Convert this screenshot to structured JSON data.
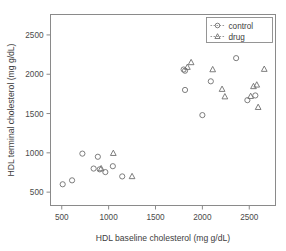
{
  "chart_data": {
    "type": "scatter",
    "title": "",
    "xlabel": "HDL baseline cholesterol (mg g/dL)",
    "ylabel": "HDL terminal cholesterol (mg g/dL)",
    "xlim": [
      380,
      2780
    ],
    "ylim": [
      330,
      2760
    ],
    "xticks": [
      500,
      1000,
      1500,
      2000,
      2500
    ],
    "xticklabels": [
      "500",
      "1000",
      "1500",
      "2000",
      "2500"
    ],
    "yticks": [
      500,
      1000,
      1500,
      2000,
      2500
    ],
    "yticklabels": [
      "500",
      "1000",
      "1500",
      "2000",
      "2500"
    ],
    "grid": false,
    "legend_position": "top-right",
    "series": [
      {
        "name": "control",
        "marker": "circle",
        "linestyle": "dashed",
        "color": "#6f6f6f",
        "points": [
          [
            510,
            600
          ],
          [
            610,
            650
          ],
          [
            720,
            990
          ],
          [
            840,
            800
          ],
          [
            885,
            950
          ],
          [
            905,
            790
          ],
          [
            965,
            755
          ],
          [
            1045,
            830
          ],
          [
            1145,
            700
          ],
          [
            1800,
            2060
          ],
          [
            1815,
            2045
          ],
          [
            1815,
            1800
          ],
          [
            2000,
            1480
          ],
          [
            2090,
            1910
          ],
          [
            2360,
            2205
          ],
          [
            2480,
            1670
          ],
          [
            2565,
            1730
          ]
        ]
      },
      {
        "name": "drug",
        "marker": "triangle",
        "linestyle": "dashed",
        "color": "#6f6f6f",
        "points": [
          [
            920,
            800
          ],
          [
            1050,
            995
          ],
          [
            1250,
            700
          ],
          [
            1840,
            2090
          ],
          [
            1880,
            2150
          ],
          [
            2110,
            2060
          ],
          [
            2225,
            2490
          ],
          [
            2210,
            1810
          ],
          [
            2240,
            1715
          ],
          [
            2545,
            1845
          ],
          [
            2580,
            1865
          ],
          [
            2595,
            1580
          ],
          [
            2660,
            2065
          ],
          [
            2515,
            1720
          ]
        ]
      }
    ]
  },
  "legend": {
    "entries": [
      {
        "label": "control",
        "marker": "circle"
      },
      {
        "label": "drug",
        "marker": "triangle"
      }
    ]
  }
}
